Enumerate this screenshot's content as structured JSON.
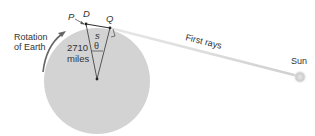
{
  "labels": {
    "P": "P",
    "D": "D",
    "Q": "Q",
    "s": "s",
    "theta": "θ",
    "distance_line1": "2710",
    "distance_line2": "miles",
    "rotation_line1": "Rotation",
    "rotation_line2": "of Earth",
    "first_rays": "First rays",
    "sun": "Sun"
  },
  "colors": {
    "earth": "#d3d3d3",
    "lines": "#555555",
    "ray": "#dddddd",
    "sun": "#cfcfcf",
    "text": "#333333"
  }
}
